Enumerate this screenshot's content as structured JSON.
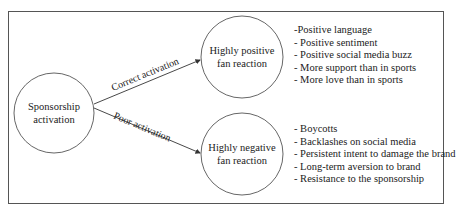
{
  "diagram": {
    "nodes": {
      "source": {
        "label_line1": "Sponsorship",
        "label_line2": "activation"
      },
      "positive": {
        "label_line1": "Highly positive",
        "label_line2": "fan reaction"
      },
      "negative": {
        "label_line1": "Highly negative",
        "label_line2": "fan reaction"
      }
    },
    "edges": {
      "correct": {
        "label": "Correct activation"
      },
      "poor": {
        "label": "Poor activation"
      }
    },
    "positive_outcomes": [
      "-Positive language",
      "- Positive sentiment",
      "- Positive social media buzz",
      "- More support than in sports",
      "- More love than in sports"
    ],
    "negative_outcomes": [
      "- Boycotts",
      "- Backlashes on social media",
      "- Persistent intent to damage the brand",
      "- Long-term aversion to brand",
      "- Resistance to the sponsorship"
    ],
    "colors": {
      "stroke": "#555555",
      "text": "#222222",
      "background": "#ffffff"
    }
  }
}
